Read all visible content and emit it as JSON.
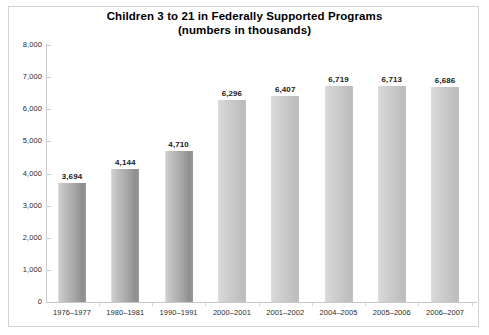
{
  "chart_data": {
    "type": "bar",
    "title": "Children 3 to 21 in Federally Supported Programs",
    "subtitle": "(numbers in thousands)",
    "xlabel": "",
    "ylabel": "",
    "ylim": [
      0,
      8000
    ],
    "ytick_labels": [
      "8,000",
      "7,000",
      "6,000",
      "5,000",
      "4,000",
      "3,000",
      "2,000",
      "1,000",
      "0"
    ],
    "ytick_values": [
      8000,
      7000,
      6000,
      5000,
      4000,
      3000,
      2000,
      1000,
      0
    ],
    "grid": false,
    "legend": false,
    "categories": [
      "1976–1977",
      "1980–1981",
      "1990–1991",
      "2000–2001",
      "2001–2002",
      "2004–2005",
      "2005–2006",
      "2006–2007"
    ],
    "values": [
      3694,
      4144,
      4710,
      6296,
      6407,
      6719,
      6713,
      6686
    ],
    "value_labels": [
      "3,694",
      "4,144",
      "4,710",
      "6,296",
      "6,407",
      "6,719",
      "6,713",
      "6,686"
    ],
    "bar_color_light": "#d2d2d2",
    "bar_color_dark": "#8e8e8e",
    "axis_color": "#c9c9c9",
    "text_color": "#1a1a1a"
  }
}
